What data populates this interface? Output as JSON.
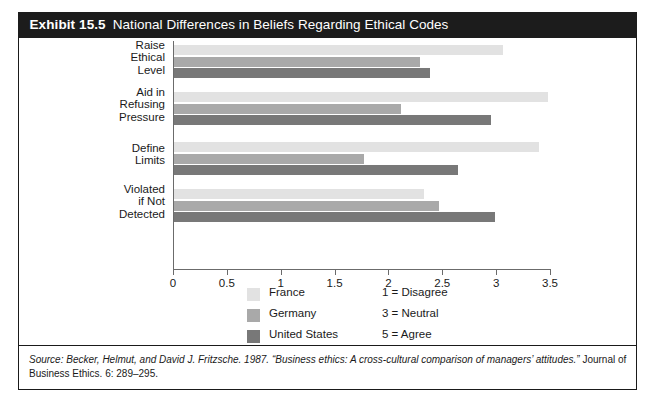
{
  "exhibit": {
    "number": "Exhibit 15.5",
    "title": "National Differences in Beliefs Regarding Ethical Codes"
  },
  "chart_data": {
    "type": "bar",
    "orientation": "horizontal",
    "title": "National Differences in Beliefs Regarding Ethical Codes",
    "xlabel": "",
    "ylabel": "",
    "xlim": [
      0,
      3.5
    ],
    "xticks": [
      "0",
      "0.5",
      "1",
      "1.5",
      "2",
      "2.5",
      "3",
      "3.5"
    ],
    "xtick_values": [
      0,
      0.5,
      1,
      1.5,
      2,
      2.5,
      3,
      3.5
    ],
    "grid": false,
    "legend_position": "bottom-center",
    "categories": [
      "Raise\nEthical\nLevel",
      "Aid in\nRefusing\nPressure",
      "Define\nLimits",
      "Violated\nif Not\nDetected"
    ],
    "series": [
      {
        "name": "France",
        "color": "#e2e2e2",
        "values": [
          3.05,
          3.47,
          3.39,
          2.32
        ]
      },
      {
        "name": "Germany",
        "color": "#a9a9a9",
        "values": [
          2.28,
          2.11,
          1.76,
          2.46
        ]
      },
      {
        "name": "United States",
        "color": "#787878",
        "values": [
          2.38,
          2.94,
          2.64,
          2.98
        ]
      }
    ],
    "scale_notes": [
      "1 = Disagree",
      "3 = Neutral",
      "5 = Agree"
    ]
  },
  "source": {
    "prefix": "Source:",
    "text": " Becker, Helmut, and David J. Fritzsche. 1987. “Business ethics: A cross-cultural comparison of managers’ attitudes.” ",
    "journal": "Journal of Business Ethics.",
    "citation": " 6: 289–295."
  }
}
